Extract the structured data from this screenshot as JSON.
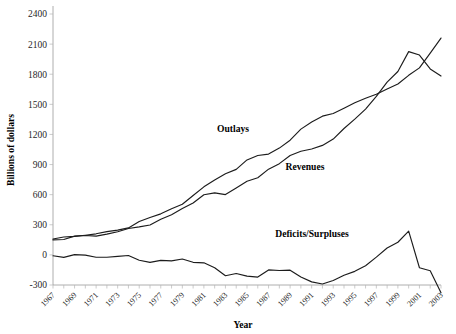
{
  "chart_data": {
    "type": "line",
    "title": "",
    "xlabel": "Year",
    "ylabel": "Billions of dollars",
    "xlim": [
      1967,
      2003
    ],
    "ylim": [
      -300,
      2400
    ],
    "ytick_step": 300,
    "grid": false,
    "legend_position": "inline-annotations",
    "yticks": [
      "2400",
      "2100",
      "1800",
      "1500",
      "1200",
      "900",
      "600",
      "300",
      "0",
      "-300"
    ],
    "xticks": [
      "1967",
      "1969",
      "1971",
      "1973",
      "1975",
      "1977",
      "1979",
      "1981",
      "1983",
      "1985",
      "1987",
      "1989",
      "1991",
      "1993",
      "1995",
      "1997",
      "1999",
      "2001",
      "2003"
    ],
    "x": [
      1967,
      1968,
      1969,
      1970,
      1971,
      1972,
      1973,
      1974,
      1975,
      1976,
      1977,
      1978,
      1979,
      1980,
      1981,
      1982,
      1983,
      1984,
      1985,
      1986,
      1987,
      1988,
      1989,
      1990,
      1991,
      1992,
      1993,
      1994,
      1995,
      1996,
      1997,
      1998,
      1999,
      2000,
      2001,
      2002,
      2003
    ],
    "series": [
      {
        "name": "Outlays",
        "label": "Outlays",
        "color": "#1c1c1c",
        "values": [
          158,
          178,
          184,
          196,
          210,
          232,
          247,
          269,
          332,
          372,
          409,
          459,
          504,
          591,
          678,
          746,
          808,
          852,
          946,
          990,
          1004,
          1064,
          1143,
          1253,
          1324,
          1382,
          1409,
          1462,
          1516,
          1561,
          1601,
          1653,
          1702,
          1789,
          1863,
          2011,
          2160
        ]
      },
      {
        "name": "Revenues",
        "label": "Revenues",
        "color": "#1c1c1c",
        "values": [
          149,
          153,
          187,
          193,
          187,
          207,
          231,
          263,
          279,
          298,
          356,
          400,
          463,
          517,
          599,
          618,
          601,
          666,
          734,
          769,
          854,
          909,
          991,
          1032,
          1055,
          1091,
          1154,
          1259,
          1352,
          1453,
          1579,
          1722,
          1827,
          2025,
          1991,
          1853,
          1782
        ]
      },
      {
        "name": "Deficits/Surpluses",
        "label": "Deficits/Surpluses",
        "color": "#1c1c1c",
        "values": [
          -9,
          -25,
          3,
          -3,
          -23,
          -23,
          -15,
          -6,
          -53,
          -74,
          -54,
          -59,
          -41,
          -74,
          -79,
          -128,
          -208,
          -185,
          -212,
          -221,
          -150,
          -155,
          -152,
          -221,
          -269,
          -290,
          -255,
          -203,
          -164,
          -108,
          -22,
          69,
          126,
          236,
          -128,
          -158,
          -378
        ]
      }
    ],
    "annotations": [
      {
        "text": "Outlays",
        "x_px": 233,
        "y_px": 132
      },
      {
        "text": "Revenues",
        "x_px": 305,
        "y_px": 170
      },
      {
        "text": "Deficits/Surpluses",
        "x_px": 312,
        "y_px": 237
      }
    ]
  }
}
